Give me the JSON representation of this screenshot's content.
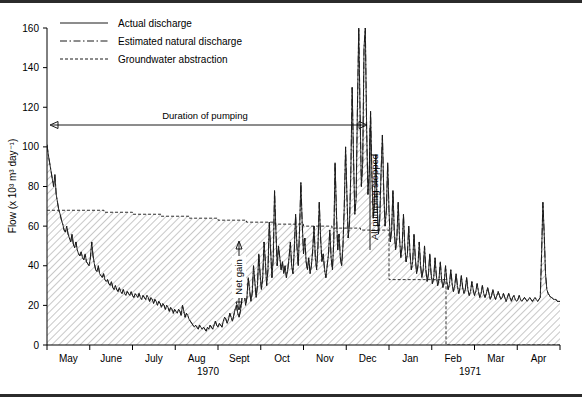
{
  "chart_data": {
    "type": "line",
    "title": "",
    "xlabel": "",
    "ylabel": "Flow (x 10³ m³ day⁻¹)",
    "ylim": [
      0,
      160
    ],
    "yticks": [
      0,
      20,
      40,
      60,
      80,
      100,
      120,
      140,
      160
    ],
    "ytick_labels": [
      "0",
      "20",
      "40",
      "60",
      "80",
      "100",
      "120",
      "140",
      "160"
    ],
    "grid": false,
    "legend_position": "top-left",
    "x_categories": [
      "May",
      "June",
      "July",
      "Aug",
      "Sept",
      "Oct",
      "Nov",
      "Dec",
      "Jan",
      "Feb",
      "Mar",
      "Apr"
    ],
    "x_group_labels": [
      {
        "label": "1970",
        "start_month": "May",
        "end_month": "Dec"
      },
      {
        "label": "1971",
        "start_month": "Jan",
        "end_month": "Apr"
      }
    ],
    "series": [
      {
        "name": "Actual discharge",
        "style": "solid",
        "values": [
          101,
          96,
          92,
          88,
          84,
          80,
          86,
          76,
          72,
          68,
          66,
          63,
          61,
          58,
          57,
          60,
          56,
          54,
          52,
          56,
          51,
          49,
          52,
          48,
          46,
          45,
          47,
          44,
          43,
          46,
          42,
          41,
          40,
          44,
          52,
          45,
          41,
          38,
          37,
          40,
          36,
          35,
          34,
          36,
          33,
          32,
          33,
          31,
          30,
          32,
          29,
          28,
          30,
          28,
          27,
          29,
          27,
          26,
          28,
          26,
          25,
          27,
          26,
          25,
          27,
          25,
          24,
          26,
          25,
          24,
          26,
          24,
          23,
          25,
          24,
          23,
          25,
          24,
          22,
          24,
          23,
          21,
          23,
          22,
          20,
          22,
          21,
          19,
          21,
          20,
          18,
          20,
          19,
          17,
          19,
          18,
          16,
          18,
          17,
          16,
          18,
          17,
          15,
          20,
          17,
          14,
          16,
          15,
          13,
          12,
          11,
          10,
          9,
          10,
          9,
          8,
          10,
          9,
          8,
          9,
          8,
          7,
          9,
          8,
          10,
          9,
          8,
          10,
          12,
          10,
          9,
          11,
          10,
          9,
          12,
          14,
          13,
          11,
          13,
          16,
          14,
          12,
          15,
          18,
          20,
          16,
          14,
          17,
          22,
          30,
          26,
          20,
          24,
          34,
          28,
          22,
          26,
          40,
          32,
          24,
          30,
          46,
          36,
          28,
          34,
          52,
          42,
          30,
          38,
          62,
          48,
          34,
          44,
          78,
          58,
          40,
          50,
          44,
          38,
          42,
          36,
          40,
          34,
          38,
          44,
          52,
          40,
          36,
          48,
          66,
          50,
          40,
          58,
          82,
          62,
          46,
          54,
          42,
          38,
          44,
          36,
          40,
          48,
          60,
          44,
          38,
          50,
          72,
          54,
          42,
          46,
          38,
          34,
          40,
          46,
          58,
          44,
          38,
          52,
          92,
          68,
          48,
          56,
          44,
          40,
          50,
          70,
          100,
          76,
          54,
          62,
          88,
          130,
          96,
          66,
          74,
          120,
          160,
          118,
          80,
          92,
          150,
          160,
          110,
          76,
          88,
          118,
          86,
          64,
          72,
          96,
          70,
          56,
          64,
          88,
          106,
          78,
          60,
          68,
          92,
          68,
          52,
          58,
          78,
          58,
          48,
          54,
          72,
          54,
          44,
          50,
          66,
          50,
          42,
          46,
          60,
          46,
          38,
          42,
          56,
          44,
          36,
          40,
          52,
          40,
          34,
          38,
          50,
          38,
          32,
          36,
          46,
          36,
          31,
          34,
          44,
          35,
          30,
          33,
          42,
          33,
          29,
          32,
          40,
          32,
          28,
          31,
          38,
          31,
          27,
          30,
          36,
          30,
          26,
          29,
          35,
          29,
          26,
          28,
          34,
          28,
          25,
          27,
          32,
          28,
          25,
          27,
          31,
          27,
          24,
          26,
          30,
          26,
          24,
          26,
          29,
          26,
          23,
          25,
          28,
          25,
          23,
          25,
          27,
          25,
          23,
          24,
          26,
          24,
          22,
          24,
          26,
          24,
          22,
          24,
          25,
          23,
          22,
          23,
          25,
          23,
          22,
          23,
          24,
          23,
          22,
          23,
          24,
          23,
          22,
          23,
          24,
          23,
          22,
          23,
          24,
          46,
          72,
          56,
          36,
          28,
          26,
          25,
          24,
          24,
          23,
          23,
          23,
          22,
          22,
          22
        ]
      },
      {
        "name": "Estimated natural discharge",
        "style": "dash-dot",
        "values": [
          101,
          96,
          92,
          88,
          84,
          80,
          86,
          76,
          72,
          68,
          66,
          63,
          61,
          58,
          57,
          60,
          56,
          54,
          52,
          56,
          51,
          49,
          52,
          48,
          46,
          45,
          47,
          44,
          43,
          46,
          42,
          41,
          40,
          44,
          52,
          45,
          41,
          38,
          37,
          40,
          36,
          35,
          34,
          36,
          33,
          32,
          33,
          31,
          30,
          32,
          29,
          28,
          30,
          28,
          27,
          29,
          27,
          26,
          28,
          26,
          25,
          27,
          26,
          25,
          27,
          25,
          24,
          26,
          25,
          24,
          26,
          24,
          23,
          25,
          24,
          23,
          25,
          24,
          22,
          24,
          23,
          21,
          23,
          22,
          20,
          22,
          21,
          19,
          21,
          20,
          18,
          20,
          19,
          17,
          19,
          18,
          16,
          18,
          17,
          16,
          18,
          17,
          15,
          20,
          17,
          14,
          16,
          15,
          13,
          12,
          11,
          10,
          9,
          10,
          9,
          8,
          10,
          9,
          8,
          9,
          8,
          7,
          9,
          8,
          10,
          9,
          8,
          10,
          12,
          10,
          9,
          11,
          10,
          9,
          12,
          14,
          13,
          11,
          13,
          16,
          14,
          12,
          15,
          18,
          20,
          16,
          14,
          17,
          22,
          30,
          26,
          20,
          24,
          34,
          28,
          22,
          26,
          40,
          32,
          24,
          30,
          46,
          36,
          28,
          34,
          52,
          42,
          30,
          38,
          62,
          48,
          34,
          44,
          78,
          58,
          40,
          50,
          44,
          38,
          42,
          36,
          40,
          34,
          38,
          44,
          52,
          40,
          36,
          48,
          66,
          50,
          40,
          58,
          82,
          62,
          46,
          54,
          42,
          38,
          44,
          36,
          40,
          48,
          60,
          44,
          38,
          50,
          72,
          54,
          42,
          46,
          38,
          34,
          40,
          46,
          58,
          44,
          38,
          52,
          92,
          68,
          48,
          56,
          44,
          40,
          50,
          70,
          100,
          76,
          54,
          62,
          88,
          130,
          96,
          66,
          74,
          120,
          160,
          118,
          80,
          92,
          150,
          160,
          110,
          76,
          88,
          118,
          86,
          64,
          72,
          96,
          70,
          56,
          64,
          88,
          106,
          78,
          60,
          68,
          92,
          68,
          52,
          58,
          78,
          58,
          48,
          54,
          72,
          54,
          44,
          50,
          66,
          50,
          42,
          46,
          60,
          46,
          38,
          42,
          56,
          44,
          36,
          40,
          52,
          40,
          34,
          38,
          50,
          38,
          32,
          36,
          46,
          36,
          31,
          34,
          44,
          35,
          30,
          33,
          42,
          33,
          29,
          32,
          40,
          32,
          28,
          31,
          38,
          31,
          27,
          30,
          36,
          30,
          26,
          29,
          35,
          29,
          26,
          28,
          34,
          28,
          25,
          27,
          32,
          28,
          25,
          27,
          31,
          27,
          24,
          26,
          30,
          26,
          24,
          26,
          29,
          26,
          23,
          25,
          28,
          25,
          23,
          25,
          27,
          25,
          23,
          24,
          26,
          24,
          22,
          24,
          26,
          24,
          22,
          24,
          25,
          23,
          22,
          23,
          25,
          23,
          22,
          23,
          24,
          23,
          22,
          23,
          24,
          23,
          22,
          23,
          24,
          23,
          22,
          23,
          24,
          46,
          72,
          56,
          36,
          28,
          26,
          25,
          24,
          24,
          23,
          23,
          23,
          22,
          22,
          22
        ]
      },
      {
        "name": "Groundwater abstraction",
        "style": "dashed",
        "values": [
          68,
          68,
          67,
          66,
          65,
          64,
          63,
          62,
          61,
          60,
          59,
          58,
          33,
          33,
          0,
          0,
          0,
          0
        ]
      }
    ],
    "annotations": [
      {
        "name": "duration-of-pumping",
        "text": "Duration of pumping",
        "type": "double-arrow-horizontal"
      },
      {
        "name": "all-pumping-stopped",
        "text": "All pumping stopped",
        "type": "vertical-label"
      },
      {
        "name": "net-gain",
        "text": "Net gain",
        "type": "double-arrow-vertical"
      }
    ]
  },
  "legend": {
    "items": [
      {
        "label": "Actual discharge",
        "style": "solid"
      },
      {
        "label": "Estimated natural discharge",
        "style": "dash-dot"
      },
      {
        "label": "Groundwater abstraction",
        "style": "dashed"
      }
    ]
  },
  "axes": {
    "y_title": "Flow (x 10³ m³ day⁻¹)",
    "y_ticks": [
      "160",
      "140",
      "120",
      "100",
      "80",
      "60",
      "40",
      "20",
      "0"
    ],
    "x_months": [
      "May",
      "June",
      "July",
      "Aug",
      "Sept",
      "Oct",
      "Nov",
      "Dec",
      "Jan",
      "Feb",
      "Mar",
      "Apr"
    ],
    "year_left": "1970",
    "year_right": "1971"
  },
  "annotations": {
    "duration_of_pumping": "Duration of pumping",
    "all_pumping_stopped": "All pumping stopped",
    "net_gain": "Net gain"
  },
  "colors": {
    "ink": "#1a1a1a",
    "hatch": "#8a8a8a",
    "background": "#ffffff"
  }
}
